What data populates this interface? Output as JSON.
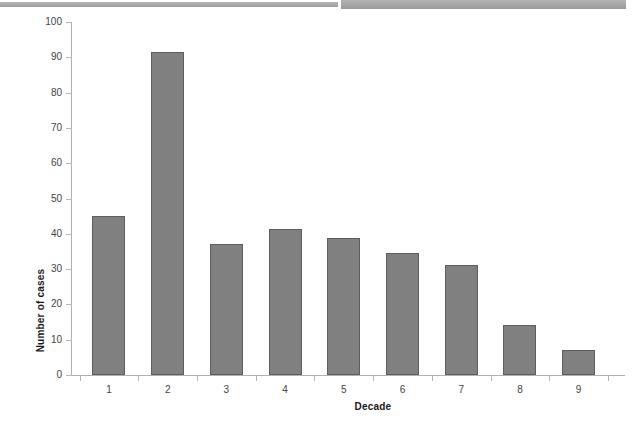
{
  "decor": {
    "band_left_name": "scan-band-left",
    "band_right_name": "scan-band-right",
    "band_color": "#a9a9a9"
  },
  "chart_data": {
    "type": "bar",
    "title": "",
    "subtitle": "",
    "xlabel": "Decade",
    "ylabel": "Number of cases",
    "categories": [
      "1",
      "2",
      "3",
      "4",
      "5",
      "6",
      "7",
      "8",
      "9"
    ],
    "values": [
      45,
      91.5,
      37,
      41.5,
      38.7,
      34.5,
      31.3,
      14.3,
      7.1
    ],
    "series": [
      {
        "name": "Number of cases",
        "values": [
          45,
          91.5,
          37,
          41.5,
          38.7,
          34.5,
          31.3,
          14.3,
          7.1
        ]
      }
    ],
    "ylim": [
      0,
      100
    ],
    "ytick_step": 10,
    "yticks": [
      0,
      10,
      20,
      30,
      40,
      50,
      60,
      70,
      80,
      90,
      100
    ],
    "ytick_labels": [
      "0",
      "10",
      "20",
      "30",
      "40",
      "50",
      "60",
      "70",
      "80",
      "90",
      "100"
    ],
    "xlim_categories": 9,
    "grid": false,
    "legend": false,
    "legend_position": "none",
    "bar_color": "#808080",
    "bar_edge_color": "#5e5e5e",
    "axis_color": "#b0b0b0"
  }
}
